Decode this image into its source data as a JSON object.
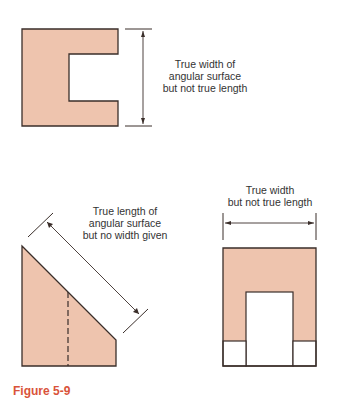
{
  "colors": {
    "fill": "#eec4ae",
    "stroke": "#3a2e2a",
    "text": "#333333",
    "caption": "#d9533a"
  },
  "views": {
    "top_left": {
      "label_lines": [
        "True width of",
        "angular surface",
        "but not true length"
      ]
    },
    "bottom_left": {
      "label_lines": [
        "True length of",
        "angular surface",
        "but no width given"
      ]
    },
    "bottom_right": {
      "label_lines": [
        "True width",
        "but not true length"
      ]
    }
  },
  "caption": "Figure 5-9"
}
